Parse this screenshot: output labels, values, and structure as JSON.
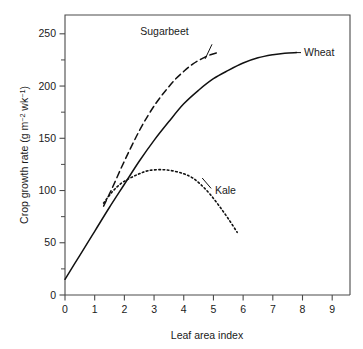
{
  "chart_data": {
    "type": "line",
    "title": "",
    "xlabel": "Leaf area index",
    "ylabel": "Crop growth rate (g m⁻² wk⁻¹)",
    "ylabel_parts": {
      "main": "Crop growth rate (g m",
      "sup1": "−2",
      "mid": " wk",
      "sup2": "−1",
      "close": ")"
    },
    "xlim": [
      0,
      9.6
    ],
    "ylim": [
      0,
      268
    ],
    "xticks": [
      0,
      1,
      2,
      3,
      4,
      5,
      6,
      7,
      8,
      9
    ],
    "xticklabels": [
      "0",
      "1",
      "2",
      "3",
      "4",
      "5",
      "6",
      "7",
      "8",
      "9"
    ],
    "yticks": [
      0,
      50,
      100,
      150,
      200,
      250
    ],
    "yticklabels": [
      "0",
      "50",
      "100",
      "150",
      "200",
      "250"
    ],
    "yminorticks": [
      25,
      75,
      125,
      175,
      225
    ],
    "grid": false,
    "legend_position": "inline-annotations",
    "series": [
      {
        "name": "Wheat",
        "style": "solid",
        "label": "Wheat",
        "label_x": 8.05,
        "label_y": 232,
        "points": [
          [
            0.0,
            15
          ],
          [
            0.5,
            38
          ],
          [
            1.0,
            61
          ],
          [
            1.5,
            84
          ],
          [
            2.0,
            106
          ],
          [
            2.5,
            128
          ],
          [
            3.0,
            148
          ],
          [
            3.5,
            166
          ],
          [
            4.0,
            183
          ],
          [
            4.5,
            196
          ],
          [
            5.0,
            207
          ],
          [
            5.5,
            215
          ],
          [
            6.0,
            222
          ],
          [
            6.5,
            227
          ],
          [
            7.0,
            230
          ],
          [
            7.4,
            231.5
          ],
          [
            7.8,
            232
          ]
        ]
      },
      {
        "name": "Sugarbeet",
        "style": "dashed",
        "label": "Sugarbeet",
        "label_x": 3.35,
        "label_y": 252,
        "points": [
          [
            1.3,
            85
          ],
          [
            1.6,
            103
          ],
          [
            1.9,
            122
          ],
          [
            2.2,
            140
          ],
          [
            2.5,
            157
          ],
          [
            2.8,
            172
          ],
          [
            3.1,
            185
          ],
          [
            3.4,
            196
          ],
          [
            3.7,
            206
          ],
          [
            4.0,
            214
          ],
          [
            4.3,
            221
          ],
          [
            4.6,
            226
          ],
          [
            4.9,
            230
          ],
          [
            5.15,
            232
          ]
        ]
      },
      {
        "name": "Kale",
        "style": "dotted",
        "label": "Kale",
        "label_x": 5.05,
        "label_y": 100,
        "points": [
          [
            1.3,
            88
          ],
          [
            1.6,
            99
          ],
          [
            1.9,
            107
          ],
          [
            2.2,
            112
          ],
          [
            2.5,
            116
          ],
          [
            2.8,
            119
          ],
          [
            3.2,
            120
          ],
          [
            3.6,
            119
          ],
          [
            4.0,
            116
          ],
          [
            4.3,
            112
          ],
          [
            4.6,
            105
          ],
          [
            4.9,
            96
          ],
          [
            5.2,
            85
          ],
          [
            5.5,
            73
          ],
          [
            5.8,
            60
          ]
        ]
      }
    ],
    "annotations": [
      {
        "name": "wheat-leader",
        "from_x": 7.75,
        "from_y": 232,
        "to_x": 7.95,
        "to_y": 232
      },
      {
        "name": "sugarbeet-leader",
        "from_x": 4.95,
        "from_y": 240,
        "to_x": 4.72,
        "to_y": 226
      },
      {
        "name": "kale-leader",
        "from_x": 4.62,
        "from_y": 112,
        "to_x": 4.92,
        "to_y": 102
      }
    ]
  }
}
